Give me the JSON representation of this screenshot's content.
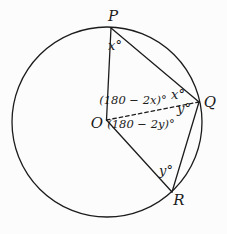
{
  "figure": {
    "colors": {
      "background": "#fcfcfc",
      "stroke": "#1c1c1c",
      "text": "#1b1b1b"
    },
    "vertex_labels": {
      "P": "P",
      "Q": "Q",
      "R": "R",
      "O": "O"
    },
    "angle_labels": {
      "at_P": "x°",
      "at_Q_upper": "x°",
      "at_Q_lower": "y°",
      "at_R": "y°",
      "central_POQ": "(180 − 2x)°",
      "central_QOR": "(180 − 2y)°"
    }
  }
}
